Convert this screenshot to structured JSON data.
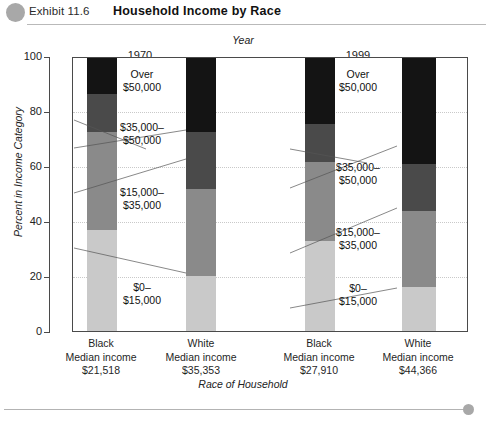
{
  "header": {
    "bullet_icon": "circle-bullet-icon",
    "exhibit_label": "Exhibit 11.6",
    "title": "Household Income by Race"
  },
  "chart_data": {
    "type": "bar",
    "subtype": "stacked-100-percent",
    "title": "Household Income by Race",
    "xlabel": "Race of Household",
    "ylabel": "Percent in Income Category",
    "top_axis_label": "Year",
    "ylim": [
      0,
      100
    ],
    "yticks": [
      0,
      20,
      40,
      60,
      80,
      100
    ],
    "grid": true,
    "grid_style": "dotted-horizontal",
    "groups": [
      {
        "year": "1970",
        "categories": [
          "Black",
          "White"
        ]
      },
      {
        "year": "1999",
        "categories": [
          "Black",
          "White"
        ]
      }
    ],
    "categories": [
      "Black",
      "White",
      "Black",
      "White"
    ],
    "category_sublabels": [
      {
        "race": "Black",
        "line2": "Median income",
        "line3": "$21,518"
      },
      {
        "race": "White",
        "line2": "Median income",
        "line3": "$35,353"
      },
      {
        "race": "Black",
        "line2": "Median income",
        "line3": "$27,910"
      },
      {
        "race": "White",
        "line2": "Median income",
        "line3": "$44,366"
      }
    ],
    "series": [
      {
        "name": "$0–\n$15,000",
        "label_line1": "$0–",
        "label_line2": "$15,000",
        "color": "#c9c9c9",
        "values": [
          37,
          20,
          33,
          16
        ]
      },
      {
        "name": "$15,000–\n$35,000",
        "label_line1": "$15,000–",
        "label_line2": "$35,000",
        "color": "#8a8a8a",
        "values": [
          36,
          32,
          29,
          28
        ]
      },
      {
        "name": "$35,000–\n$50,000",
        "label_line1": "$35,000–",
        "label_line2": "$50,000",
        "color": "#4a4a4a",
        "values": [
          14,
          21,
          14,
          17
        ]
      },
      {
        "name": "Over\n$50,000",
        "label_line1": "Over",
        "label_line2": "$50,000",
        "color": "#141414",
        "values": [
          13,
          27,
          24,
          39
        ]
      }
    ],
    "cumulative_boundaries": {
      "black_1970": [
        37,
        73,
        87
      ],
      "white_1970": [
        20,
        52,
        73
      ],
      "black_1999": [
        33,
        62,
        76
      ],
      "white_1999": [
        16,
        44,
        61
      ]
    }
  },
  "callouts": {
    "group_1970": [
      {
        "line1": "Over",
        "line2": "$50,000"
      },
      {
        "line1": "$35,000–",
        "line2": "$50,000"
      },
      {
        "line1": "$15,000–",
        "line2": "$35,000"
      },
      {
        "line1": "$0–",
        "line2": "$15,000"
      }
    ],
    "group_1999": [
      {
        "line1": "Over",
        "line2": "$50,000"
      },
      {
        "line1": "$35,000–",
        "line2": "$50,000"
      },
      {
        "line1": "$15,000–",
        "line2": "$35,000"
      },
      {
        "line1": "$0–",
        "line2": "$15,000"
      }
    ]
  },
  "footer": {
    "dot_icon": "circle-dot-icon"
  }
}
